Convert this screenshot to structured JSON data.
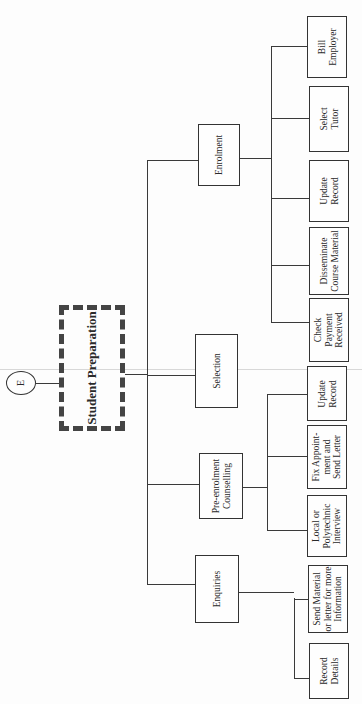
{
  "diagram": {
    "type": "hierarchy-chart",
    "orientation": "rotated-90-ccw",
    "connector": {
      "label": "E"
    },
    "root": {
      "label": "Student Preparation"
    },
    "branches": [
      {
        "label": "Enquiries",
        "children": [
          {
            "label": "Record\nDetails"
          },
          {
            "label": "Send Material\nor letter for more\nInformation"
          }
        ]
      },
      {
        "label": "Pre-enrolment\nCounselling",
        "children": [
          {
            "label": "Local or\nPolytechnic\nInterview"
          },
          {
            "label": "Fix Appoint-\nment and\nSend Letter"
          },
          {
            "label": "Update\nRecord"
          }
        ]
      },
      {
        "label": "Selection",
        "children": []
      },
      {
        "label": "Enrolment",
        "children": [
          {
            "label": "Check\nPayment\nReceived"
          },
          {
            "label": "Disseminate\nCourse Material"
          },
          {
            "label": "Update\nRecord"
          },
          {
            "label": "Select\nTutor"
          },
          {
            "label": "Bill\nEmployer"
          }
        ]
      }
    ]
  }
}
